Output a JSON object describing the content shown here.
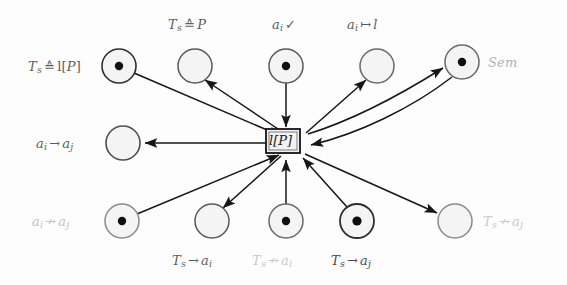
{
  "figure": {
    "kind": "petri-net-diagram",
    "width": 567,
    "height": 285,
    "background": "#fdfdfd"
  },
  "transition": {
    "id": "t-lP",
    "label": "l[P]",
    "label_head": "l",
    "label_tail": "[P]",
    "x": 283,
    "y": 141,
    "width": 34,
    "height": 24,
    "stroke": "#141414",
    "fill": "#f2f2f2"
  },
  "places": [
    {
      "id": "p-ts-eq-lp",
      "label_parts": {
        "head": "T",
        "sub": "s",
        "op": "≙",
        "tail": "l[P]"
      },
      "label_text": "T_s ≙ l[P]",
      "cx": 119,
      "cy": 66,
      "r": 17,
      "token": true,
      "label_x": 28,
      "label_y": 60,
      "label_align": "left",
      "color": "#5d5d5d",
      "stroke": "#2e2e2e"
    },
    {
      "id": "p-ts-eq-p",
      "label_parts": {
        "head": "T",
        "sub": "s",
        "op": "≙",
        "tail": "P"
      },
      "label_text": "T_s ≙ P",
      "cx": 195,
      "cy": 66,
      "r": 17,
      "token": false,
      "label_x": 168,
      "label_y": 18,
      "label_align": "left",
      "color": "#5d5d5d",
      "stroke": "#5a5a5a"
    },
    {
      "id": "p-ai-check",
      "label_parts": {
        "head": "a",
        "sub": "i",
        "op": "✓",
        "tail": ""
      },
      "label_text": "a_i ✓",
      "cx": 286,
      "cy": 66,
      "r": 17,
      "token": true,
      "label_x": 272,
      "label_y": 18,
      "label_align": "left",
      "color": "#5d5d5d",
      "stroke": "#5a5a5a"
    },
    {
      "id": "p-ai-maps-l",
      "label_parts": {
        "head": "a",
        "sub": "i",
        "op": "↦",
        "tail": "l"
      },
      "label_text": "a_i ↦ l",
      "cx": 377,
      "cy": 66,
      "r": 17,
      "token": false,
      "label_x": 347,
      "label_y": 18,
      "label_align": "left",
      "color": "#5d5d5d",
      "stroke": "#6a6a6a"
    },
    {
      "id": "p-sem",
      "label_parts": {
        "head": "Sem",
        "sub": "",
        "op": "",
        "tail": ""
      },
      "label_text": "Sem",
      "cx": 462,
      "cy": 62,
      "r": 17,
      "token": true,
      "label_x": 488,
      "label_y": 56,
      "label_align": "left",
      "color": "#b2b2b2",
      "stroke": "#6a6a6a"
    },
    {
      "id": "p-ai-to-aj",
      "label_parts": {
        "head": "a",
        "sub": "i",
        "op": "→",
        "tail": "a",
        "tail_sub": "j"
      },
      "label_text": "a_i → a_j",
      "cx": 123,
      "cy": 143,
      "r": 17,
      "token": false,
      "label_x": 36,
      "label_y": 137,
      "label_align": "left",
      "color": "#5d5d5d",
      "stroke": "#4e4e4e"
    },
    {
      "id": "p-ai-nto-aj",
      "label_parts": {
        "head": "a",
        "sub": "i",
        "op": "↛",
        "tail": "a",
        "tail_sub": "j"
      },
      "label_text": "a_i ↛ a_j",
      "cx": 122,
      "cy": 221,
      "r": 17,
      "token": true,
      "label_x": 32,
      "label_y": 215,
      "label_align": "left",
      "color": "#c2c2c2",
      "stroke": "#8b8b8b"
    },
    {
      "id": "p-ts-to-ai",
      "label_parts": {
        "head": "T",
        "sub": "s",
        "op": "→",
        "tail": "a",
        "tail_sub": "i"
      },
      "label_text": "T_s → a_i",
      "cx": 212,
      "cy": 221,
      "r": 17,
      "token": false,
      "label_x": 172,
      "label_y": 254,
      "label_align": "left",
      "color": "#5d5d5d",
      "stroke": "#5a5a5a"
    },
    {
      "id": "p-ts-nto-ai",
      "label_parts": {
        "head": "T",
        "sub": "s",
        "op": "↛",
        "tail": "a",
        "tail_sub": "i"
      },
      "label_text": "T_s ↛ a_i",
      "cx": 286,
      "cy": 221,
      "r": 17,
      "token": true,
      "label_x": 252,
      "label_y": 254,
      "label_align": "left",
      "color": "#c8c8c8",
      "stroke": "#6a6a6a"
    },
    {
      "id": "p-ts-to-aj",
      "label_parts": {
        "head": "T",
        "sub": "s",
        "op": "→",
        "tail": "a",
        "tail_sub": "j"
      },
      "label_text": "T_s → a_j",
      "cx": 357,
      "cy": 221,
      "r": 17,
      "token": true,
      "label_x": 331,
      "label_y": 254,
      "label_align": "left",
      "color": "#4a4a4a",
      "stroke": "#2e2e2e"
    },
    {
      "id": "p-ts-nto-aj",
      "label_parts": {
        "head": "T",
        "sub": "s",
        "op": "↛",
        "tail": "a",
        "tail_sub": "j"
      },
      "label_text": "T_s ↛ a_j",
      "cx": 455,
      "cy": 221,
      "r": 17,
      "token": false,
      "label_x": 483,
      "label_y": 215,
      "label_align": "left",
      "color": "#c8c8c8",
      "stroke": "#8b8b8b"
    }
  ],
  "arcs": [
    {
      "id": "arc-ts-eq-lp-to-t",
      "from": "p-ts-eq-lp",
      "to": "t-lP",
      "direction": "place-to-transition",
      "curved": false
    },
    {
      "id": "arc-t-to-ts-eq-p",
      "from": "t-lP",
      "to": "p-ts-eq-p",
      "direction": "transition-to-place",
      "curved": false
    },
    {
      "id": "arc-ai-check-to-t",
      "from": "p-ai-check",
      "to": "t-lP",
      "direction": "place-to-transition",
      "curved": false
    },
    {
      "id": "arc-t-to-ai-maps-l",
      "from": "t-lP",
      "to": "p-ai-maps-l",
      "direction": "transition-to-place",
      "curved": false
    },
    {
      "id": "arc-t-to-sem",
      "from": "t-lP",
      "to": "p-sem",
      "direction": "transition-to-place",
      "curved": true
    },
    {
      "id": "arc-sem-to-t",
      "from": "p-sem",
      "to": "t-lP",
      "direction": "place-to-transition",
      "curved": true
    },
    {
      "id": "arc-t-to-ai-to-aj",
      "from": "t-lP",
      "to": "p-ai-to-aj",
      "direction": "transition-to-place",
      "curved": false
    },
    {
      "id": "arc-ai-nto-aj-to-t",
      "from": "p-ai-nto-aj",
      "to": "t-lP",
      "direction": "place-to-transition",
      "curved": false
    },
    {
      "id": "arc-t-to-ts-to-ai",
      "from": "t-lP",
      "to": "p-ts-to-ai",
      "direction": "transition-to-place",
      "curved": false
    },
    {
      "id": "arc-ts-nto-ai-to-t",
      "from": "p-ts-nto-ai",
      "to": "t-lP",
      "direction": "place-to-transition",
      "curved": false
    },
    {
      "id": "arc-ts-to-aj-to-t",
      "from": "p-ts-to-aj",
      "to": "t-lP",
      "direction": "place-to-transition",
      "curved": false
    },
    {
      "id": "arc-t-to-ts-nto-aj",
      "from": "t-lP",
      "to": "p-ts-nto-aj",
      "direction": "transition-to-place",
      "curved": false
    }
  ]
}
